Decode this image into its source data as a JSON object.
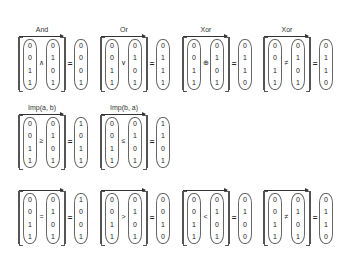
{
  "inputs": {
    "a": [
      "0",
      "0",
      "1",
      "1"
    ],
    "b": [
      "0",
      "1",
      "0",
      "1"
    ]
  },
  "equals_symbol": "=",
  "blocks": [
    {
      "label": "And",
      "op": "∧",
      "result": [
        "0",
        "0",
        "0",
        "1"
      ]
    },
    {
      "label": "Or",
      "op": "∨",
      "result": [
        "0",
        "1",
        "1",
        "1"
      ]
    },
    {
      "label": "Xor",
      "op": "⊕",
      "result": [
        "0",
        "1",
        "1",
        "0"
      ]
    },
    {
      "label": "Xor",
      "op": "≠",
      "result": [
        "0",
        "1",
        "1",
        "0"
      ]
    },
    {
      "label": "Imp(a, b)",
      "op": "≥",
      "result": [
        "1",
        "0",
        "1",
        "1"
      ]
    },
    {
      "label": "Imp(b, a)",
      "op": "≤",
      "result": [
        "1",
        "1",
        "0",
        "1"
      ]
    },
    {
      "label": "",
      "op": "=",
      "result": [
        "1",
        "0",
        "0",
        "1"
      ]
    },
    {
      "label": "",
      "op": ">",
      "result": [
        "0",
        "0",
        "1",
        "0"
      ]
    },
    {
      "label": "",
      "op": "<",
      "result": [
        "0",
        "1",
        "0",
        "0"
      ]
    },
    {
      "label": "",
      "op": "≠",
      "result": [
        "0",
        "1",
        "1",
        "0"
      ]
    }
  ]
}
